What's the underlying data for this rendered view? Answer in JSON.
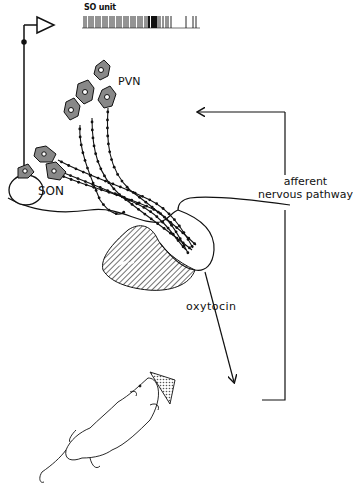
{
  "figure": {
    "type": "schematic diagram",
    "labels": {
      "recording": "SO unit",
      "paraventricular": "PVN",
      "supraoptic": "SON",
      "afferent_line1": "afferent",
      "afferent_line2": "nervous pathway",
      "hormone": "oxytocin"
    },
    "elements": [
      "recording-electrode-amplifier",
      "spike-train-trace",
      "PVN-neurons",
      "SON-neurons",
      "optic-chiasm",
      "hypothalamus-outline",
      "posterior-pituitary",
      "oxytocin-arrow",
      "suckling-rat-with-pups",
      "afferent-feedback-pathway"
    ],
    "colors": {
      "ink": "#111111",
      "background": "#ffffff",
      "cell_fill": "#888888"
    }
  }
}
